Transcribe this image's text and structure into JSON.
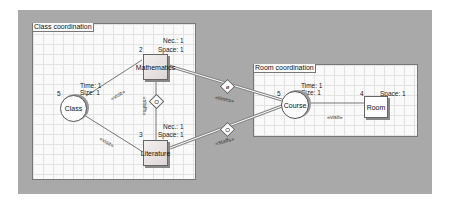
{
  "panels": {
    "class": {
      "title": "Class coordination"
    },
    "room": {
      "title": "Room coordination"
    }
  },
  "nodes": {
    "class": {
      "label": "Class",
      "count": "5",
      "time": "Time: 1",
      "size": "Size: 1"
    },
    "mathematics": {
      "label": "Mathematics",
      "count": "2",
      "nec": "Nec.: 1",
      "space": "Space: 1"
    },
    "literature": {
      "label": "Literature",
      "count": "3",
      "nec": "Nec.: 1",
      "space": "Space: 1"
    },
    "course": {
      "label": "Course",
      "count": "5",
      "time": "Time: 1",
      "size": "Size: 1"
    },
    "room": {
      "label": "Room",
      "count": "4",
      "space": "Space: 1"
    }
  },
  "edges": {
    "class_math": "«visit»",
    "class_lit": "«visit»",
    "math_lit": "«staffs»",
    "math_course": "«times»",
    "lit_course": "«staffs»",
    "course_room": "«visit»"
  },
  "diamonds": {
    "math_lit": "O",
    "math_course": "ø",
    "lit_course": "O"
  }
}
